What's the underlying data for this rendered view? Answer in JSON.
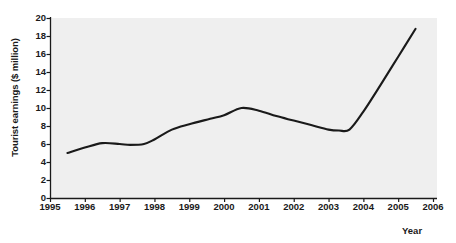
{
  "chart_data": {
    "type": "line",
    "title": "",
    "xlabel": "Year",
    "ylabel": "Tourist earnings ($ million)",
    "xlim": [
      1995,
      2006
    ],
    "ylim": [
      0,
      20
    ],
    "grid": false,
    "legend": null,
    "xticks": [
      "1995",
      "1996",
      "1997",
      "1998",
      "1999",
      "2000",
      "2001",
      "2002",
      "2003",
      "2004",
      "2005",
      "2006"
    ],
    "yticks": [
      "0",
      "2",
      "4",
      "6",
      "8",
      "10",
      "12",
      "14",
      "16",
      "18",
      "20"
    ],
    "line_color": "#1a1a1a",
    "plot_background": "#efefef",
    "series": [
      {
        "name": "Tourist earnings",
        "x": [
          1995.5,
          1996.0,
          1996.5,
          1997.0,
          1997.3,
          1997.7,
          1998.0,
          1998.5,
          1999.0,
          1999.6,
          2000.0,
          2000.5,
          2001.0,
          2001.5,
          2002.0,
          2002.5,
          2003.0,
          2003.3,
          2003.6,
          2004.0,
          2004.5,
          2005.0,
          2005.5
        ],
        "values": [
          5.0,
          5.6,
          6.1,
          6.0,
          5.9,
          6.0,
          6.5,
          7.6,
          8.2,
          8.8,
          9.2,
          10.0,
          9.7,
          9.1,
          8.6,
          8.1,
          7.6,
          7.5,
          7.6,
          9.6,
          12.6,
          15.7,
          18.8
        ]
      }
    ]
  }
}
